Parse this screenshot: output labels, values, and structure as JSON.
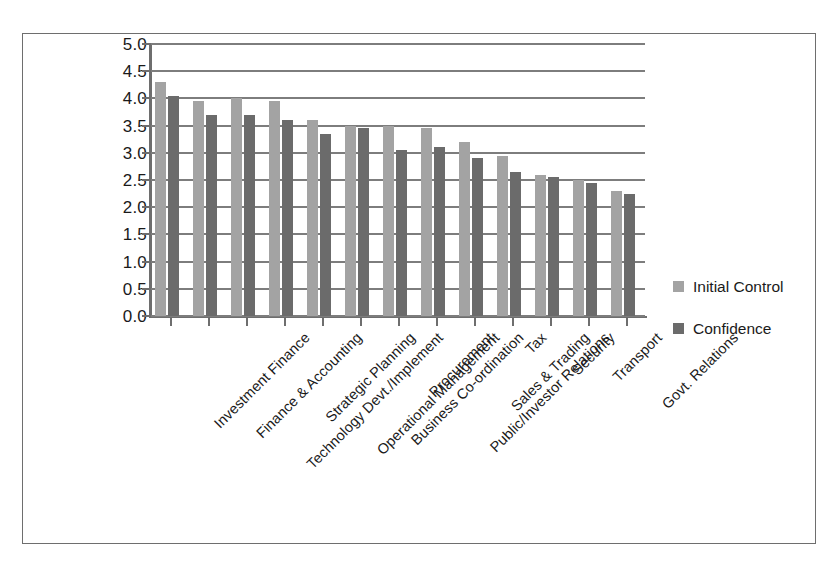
{
  "chart_data": {
    "type": "bar",
    "title": "",
    "subtitle": "",
    "xlabel": "",
    "ylabel": "",
    "ylim": [
      0.0,
      5.0
    ],
    "ytick_step": 0.5,
    "ytick_labels": [
      "5.0",
      "4.5",
      "4.0",
      "3.5",
      "3.0",
      "2.5",
      "2.0",
      "1.5",
      "1.0",
      "0.5",
      "0.0"
    ],
    "grid": true,
    "grid_axis": "y",
    "legend_position": "right",
    "xtick_label_rotation": 45,
    "categories": [
      "Investment Finance",
      "Finance & Accounting",
      "Technology Devt./Implement",
      "Strategic Planning",
      "Operational Management",
      "Business Co-ordination",
      "Procurement",
      "Public/Investor Relations",
      "Sales & Trading",
      "Tax",
      "Security",
      "Transport",
      "Govt. Relations"
    ],
    "series": [
      {
        "name": "Initial Control",
        "color": "#a3a3a3",
        "values": [
          4.3,
          3.95,
          4.0,
          3.95,
          3.6,
          3.5,
          3.5,
          3.45,
          3.2,
          2.95,
          2.6,
          2.5,
          2.3
        ]
      },
      {
        "name": "Confidence",
        "color": "#6b6b6b",
        "values": [
          4.05,
          3.7,
          3.7,
          3.6,
          3.35,
          3.45,
          3.05,
          3.1,
          2.9,
          2.65,
          2.55,
          2.45,
          2.25
        ]
      }
    ]
  },
  "legend": {
    "items": [
      {
        "label": "Initial Control",
        "color": "#a3a3a3"
      },
      {
        "label": "Confidence",
        "color": "#6b6b6b"
      }
    ]
  },
  "colors": {
    "initial_control": "#a3a3a3",
    "confidence": "#6b6b6b",
    "axis": "#6e6e6e",
    "grid": "#7d7d7d",
    "text": "#1a1a1a",
    "background": "#ffffff",
    "frame_border": "#6e6e6e"
  }
}
